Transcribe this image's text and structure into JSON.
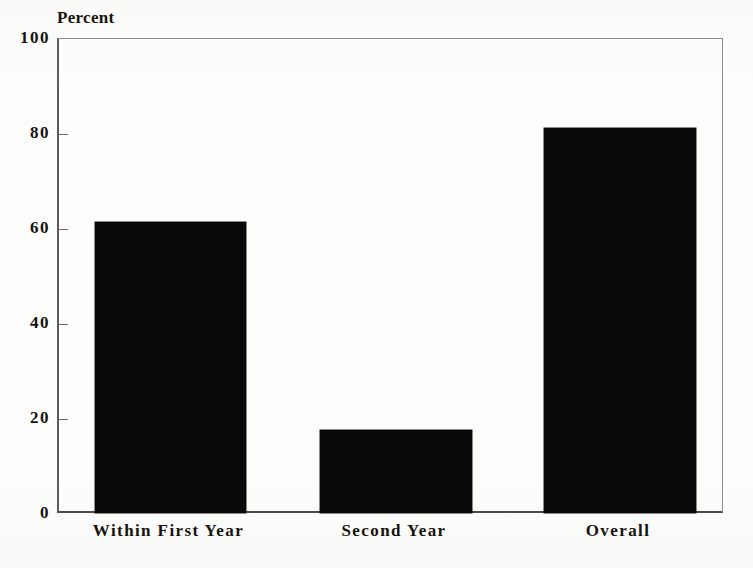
{
  "chart_data": {
    "type": "bar",
    "title": "",
    "xlabel": "",
    "ylabel": "Percent",
    "ylim": [
      0,
      100
    ],
    "yticks": [
      0,
      20,
      40,
      60,
      80,
      100
    ],
    "ytick_labels": [
      "0",
      "20",
      "40",
      "60",
      "80",
      "100"
    ],
    "grid": false,
    "legend": "none",
    "categories": [
      "Within First Year",
      "Second Year",
      "Overall"
    ],
    "values": [
      61.5,
      17.7,
      81.3
    ],
    "series": [
      {
        "name": "Percent",
        "values": [
          61.5,
          17.7,
          81.3
        ],
        "color": "#0a0a0a"
      }
    ],
    "bars": [
      {
        "label": "Within First Year",
        "value": 61.5
      },
      {
        "label": "Second Year",
        "value": 17.7
      },
      {
        "label": "Overall",
        "value": 81.3
      }
    ]
  },
  "axis": {
    "title": "Percent",
    "tick_color": "#6a6a6a",
    "frame_color": "#5d5d5d"
  },
  "colors": {
    "background": "#fdfdfb",
    "bar_fill": "#0a0a0a",
    "text": "#16130f"
  }
}
